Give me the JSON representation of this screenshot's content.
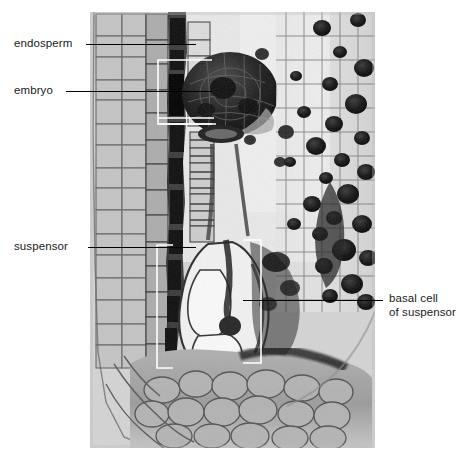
{
  "figure": {
    "kind": "light-micrograph",
    "width": 469,
    "height": 465,
    "background_color": "#ffffff",
    "plate": {
      "left": 90,
      "top": 12,
      "width": 285,
      "height": 436,
      "base_tone": "#cfcfcf",
      "description": "grayscale tissue section; dark stained embryo mass near top-left-of-center, pale vacuolate suspensor below it, granular endosperm cells filling the right side, dense parenchyma at the base"
    },
    "labels": [
      {
        "id": "endosperm",
        "text": "endosperm",
        "text_x": 14,
        "text_y": 37,
        "anchor": "left",
        "leader": {
          "x1": 86,
          "y1": 44,
          "x2": 196,
          "y2": 44,
          "color": "#000000"
        }
      },
      {
        "id": "embryo",
        "text": "embryo",
        "text_x": 14,
        "text_y": 84,
        "anchor": "left",
        "leader": {
          "x1": 66,
          "y1": 91,
          "x2": 212,
          "y2": 91,
          "color": "#000000"
        }
      },
      {
        "id": "suspensor",
        "text": "suspensor",
        "text_x": 14,
        "text_y": 240,
        "anchor": "left",
        "leader": {
          "x1": 88,
          "y1": 247,
          "x2": 196,
          "y2": 247,
          "color": "#000000"
        }
      },
      {
        "id": "basal-cell-of-suspensor",
        "text_line_1": "basal cell",
        "text_line_2": "of suspensor",
        "text_x": 389,
        "text_y": 292,
        "anchor": "right",
        "leader": {
          "x1": 243,
          "y1": 300,
          "x2": 383,
          "y2": 300,
          "color": "#000000"
        }
      }
    ],
    "callout_brackets": [
      {
        "id": "embryo-bracket",
        "color": "#ffffff",
        "shape": "open-rectangle",
        "x": 158,
        "y": 60,
        "width": 54,
        "height": 64
      },
      {
        "id": "embryo-tip-lines",
        "color": "#ffffff",
        "shape": "double-rule",
        "x1": 158,
        "y1": 118,
        "x2": 214,
        "y2": 124
      },
      {
        "id": "suspensor-bracket",
        "color": "#ffffff",
        "shape": "left-bracket",
        "x": 157,
        "y": 245,
        "width": 16,
        "height": 123
      },
      {
        "id": "basal-cell-bracket",
        "color": "#ffffff",
        "shape": "right-bracket",
        "x": 243,
        "y": 240,
        "width": 18,
        "height": 123
      }
    ]
  }
}
